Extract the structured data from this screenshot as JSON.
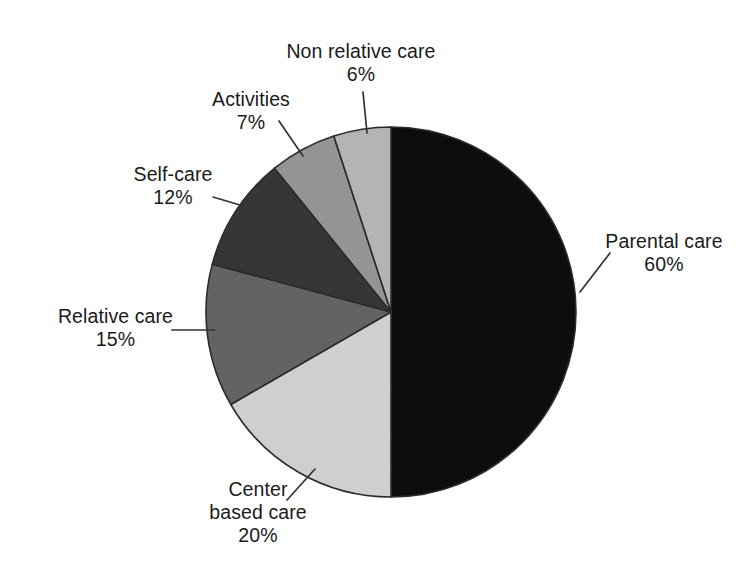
{
  "figure": {
    "background_color": "#ffffff",
    "width": 748,
    "height": 579
  },
  "chart_data": {
    "type": "pie",
    "title": "",
    "subtitle": "",
    "xlabel": "",
    "ylabel": "",
    "legend_position": "none",
    "grid": false,
    "labels_show_percent": true,
    "start_angle_deg": 90,
    "direction": "mixed",
    "categories": [
      "Parental care",
      "Center based care",
      "Relative care",
      "Self-care",
      "Activities",
      "Non relative care"
    ],
    "values": [
      60,
      20,
      15,
      12,
      7,
      6
    ],
    "value_labels": [
      "60%",
      "20%",
      "15%",
      "12%",
      "7%",
      "6%"
    ],
    "colors": [
      "#0d0d0d",
      "#cfcfcf",
      "#636363",
      "#363636",
      "#949494",
      "#b4b4b4"
    ],
    "slices": [
      {
        "name": "Parental care",
        "value": 60,
        "value_label": "60%",
        "color": "#0d0d0d",
        "label_line1": "Parental care",
        "label_line2": "60%"
      },
      {
        "name": "Center based care",
        "value": 20,
        "value_label": "20%",
        "color": "#cfcfcf",
        "label_line1": "Center",
        "label_line2": "based care",
        "label_line3": "20%"
      },
      {
        "name": "Relative care",
        "value": 15,
        "value_label": "15%",
        "color": "#636363",
        "label_line1": "Relative care",
        "label_line2": "15%"
      },
      {
        "name": "Self-care",
        "value": 12,
        "value_label": "12%",
        "color": "#363636",
        "label_line1": "Self-care",
        "label_line2": "12%"
      },
      {
        "name": "Activities",
        "value": 7,
        "value_label": "7%",
        "color": "#949494",
        "label_line1": "Activities",
        "label_line2": "7%"
      },
      {
        "name": "Non relative care",
        "value": 6,
        "value_label": "6%",
        "color": "#b4b4b4",
        "label_line1": "Non relative care",
        "label_line2": "6%"
      }
    ]
  }
}
